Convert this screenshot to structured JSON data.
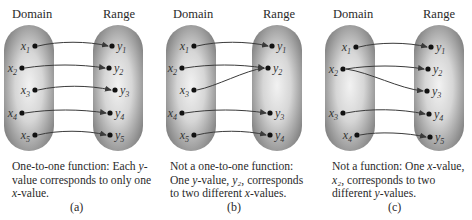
{
  "colors": {
    "oval_center": "#f2f2f2",
    "oval_edge": "#7c7c7c",
    "arrow": "#3a3a3a",
    "dot": "#111111"
  },
  "panels": [
    {
      "id": "a",
      "domain_header": "Domain",
      "range_header": "Range",
      "domain": [
        {
          "name": "x",
          "sub": "1",
          "cx": 35,
          "cy": 46
        },
        {
          "name": "x",
          "sub": "2",
          "cx": 22,
          "cy": 68
        },
        {
          "name": "x",
          "sub": "3",
          "cx": 35,
          "cy": 90
        },
        {
          "name": "x",
          "sub": "4",
          "cx": 22,
          "cy": 113
        },
        {
          "name": "x",
          "sub": "5",
          "cx": 35,
          "cy": 135
        }
      ],
      "range": [
        {
          "name": "y",
          "sub": "1",
          "cx": 112,
          "cy": 46
        },
        {
          "name": "y",
          "sub": "2",
          "cx": 109,
          "cy": 68
        },
        {
          "name": "y",
          "sub": "3",
          "cx": 115,
          "cy": 90
        },
        {
          "name": "y",
          "sub": "4",
          "cx": 110,
          "cy": 113
        },
        {
          "name": "y",
          "sub": "5",
          "cx": 110,
          "cy": 135
        }
      ],
      "mappings": [
        [
          0,
          0
        ],
        [
          1,
          1
        ],
        [
          2,
          2
        ],
        [
          3,
          3
        ],
        [
          4,
          4
        ]
      ],
      "caption_parts": [
        "One-to-one function: Each ",
        "y",
        "-value corresponds to only one ",
        "x",
        "-value."
      ],
      "label": "(a)"
    },
    {
      "id": "b",
      "domain_header": "Domain",
      "range_header": "Range",
      "domain": [
        {
          "name": "x",
          "sub": "1",
          "cx": 39,
          "cy": 46
        },
        {
          "name": "x",
          "sub": "2",
          "cx": 27,
          "cy": 68
        },
        {
          "name": "x",
          "sub": "3",
          "cx": 39,
          "cy": 90
        },
        {
          "name": "x",
          "sub": "4",
          "cx": 27,
          "cy": 113
        },
        {
          "name": "x",
          "sub": "5",
          "cx": 39,
          "cy": 135
        }
      ],
      "range": [
        {
          "name": "y",
          "sub": "1",
          "cx": 117,
          "cy": 46
        },
        {
          "name": "y",
          "sub": "2",
          "cx": 113,
          "cy": 68
        },
        {
          "name": "y",
          "sub": "3",
          "cx": 115,
          "cy": 113
        },
        {
          "name": "y",
          "sub": "4",
          "cx": 115,
          "cy": 135
        }
      ],
      "mappings": [
        [
          0,
          0
        ],
        [
          1,
          1
        ],
        [
          2,
          1
        ],
        [
          3,
          2
        ],
        [
          4,
          3
        ]
      ],
      "caption_parts": [
        "Not a one-to-one function: One ",
        "y",
        "-value, ",
        "y₂",
        ", corresponds to two different ",
        "x",
        "-values."
      ],
      "label": "(b)"
    },
    {
      "id": "c",
      "domain_header": "Domain",
      "range_header": "Range",
      "domain": [
        {
          "name": "x",
          "sub": "1",
          "cx": 44,
          "cy": 47
        },
        {
          "name": "x",
          "sub": "2",
          "cx": 31,
          "cy": 69
        },
        {
          "name": "x",
          "sub": "3",
          "cx": 31,
          "cy": 113
        },
        {
          "name": "x",
          "sub": "4",
          "cx": 45,
          "cy": 135
        }
      ],
      "range": [
        {
          "name": "y",
          "sub": "1",
          "cx": 119,
          "cy": 47
        },
        {
          "name": "y",
          "sub": "2",
          "cx": 116,
          "cy": 69
        },
        {
          "name": "y",
          "sub": "3",
          "cx": 115,
          "cy": 91
        },
        {
          "name": "y",
          "sub": "4",
          "cx": 117,
          "cy": 114
        },
        {
          "name": "y",
          "sub": "5",
          "cx": 118,
          "cy": 137
        }
      ],
      "mappings": [
        [
          0,
          0
        ],
        [
          1,
          1
        ],
        [
          1,
          2
        ],
        [
          2,
          3
        ],
        [
          3,
          4
        ]
      ],
      "caption_parts": [
        "Not a function: One ",
        "x",
        "-value, ",
        "x₂",
        ", corresponds to two different ",
        "y",
        "-values."
      ],
      "label": "(c)"
    }
  ]
}
